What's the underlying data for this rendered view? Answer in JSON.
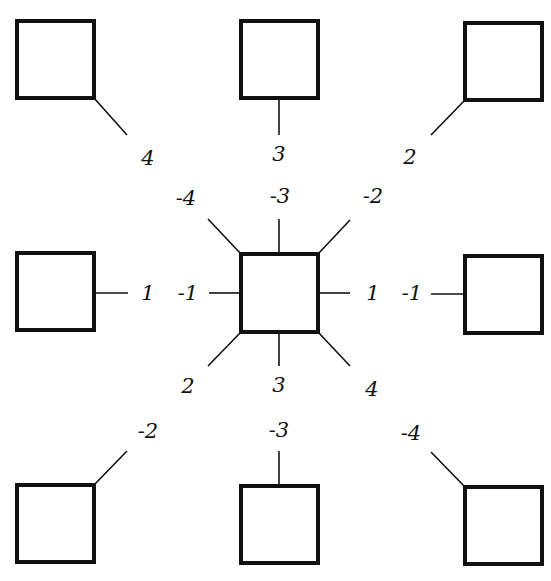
{
  "diagram": {
    "center": {
      "name": "center-square",
      "ports": [
        {
          "label": "-4",
          "direction": "upper-left"
        },
        {
          "label": "-3",
          "direction": "up"
        },
        {
          "label": "-2",
          "direction": "upper-right"
        },
        {
          "label": "-1",
          "direction": "left"
        },
        {
          "label": "1",
          "direction": "right"
        },
        {
          "label": "2",
          "direction": "lower-left"
        },
        {
          "label": "3",
          "direction": "down"
        },
        {
          "label": "4",
          "direction": "lower-right"
        }
      ]
    },
    "neighbors": [
      {
        "position": "top-left",
        "label": "4"
      },
      {
        "position": "top-middle",
        "label": "3"
      },
      {
        "position": "top-right",
        "label": "2"
      },
      {
        "position": "middle-left",
        "label": "1"
      },
      {
        "position": "middle-right",
        "label": "-1"
      },
      {
        "position": "bottom-left",
        "label": "-2"
      },
      {
        "position": "bottom-middle",
        "label": "-3"
      },
      {
        "position": "bottom-right",
        "label": "-4"
      }
    ],
    "colors": {
      "stroke": "#111111",
      "background": "#ffffff"
    }
  }
}
